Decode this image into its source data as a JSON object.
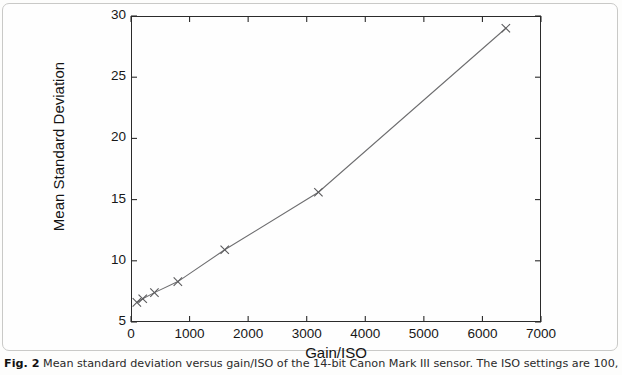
{
  "figure": {
    "caption_label": "Fig. 2",
    "caption_text": "Mean standard deviation versus gain/ISO of the 14-bit Canon Mark III sensor. The ISO settings are 100, 200, 400, 800, 1600, 3200, and 6400"
  },
  "chart_data": {
    "type": "line",
    "title": "",
    "xlabel": "Gain/ISO",
    "ylabel": "Mean Standard Deviation",
    "xlim": [
      0,
      7000
    ],
    "ylim": [
      5,
      30
    ],
    "xticks": [
      0,
      1000,
      2000,
      3000,
      4000,
      5000,
      6000,
      7000
    ],
    "yticks": [
      5,
      10,
      15,
      20,
      25,
      30
    ],
    "grid": false,
    "legend": null,
    "marker": "x",
    "line_color": "#6e6e70",
    "marker_color": "#5a5a5c",
    "axis_color": "#2b2b2b",
    "x": [
      100,
      200,
      400,
      800,
      1600,
      3200,
      6400
    ],
    "y": [
      6.6,
      6.9,
      7.4,
      8.3,
      10.9,
      15.6,
      29.0
    ],
    "iso_settings": [
      100,
      200,
      400,
      800,
      1600,
      3200,
      6400
    ],
    "series": [
      {
        "name": "Mean standard deviation",
        "x": [
          100,
          200,
          400,
          800,
          1600,
          3200,
          6400
        ],
        "values": [
          6.6,
          6.9,
          7.4,
          8.3,
          10.9,
          15.6,
          29.0
        ]
      }
    ]
  }
}
